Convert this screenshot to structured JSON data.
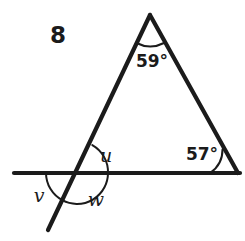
{
  "figure": {
    "exercise_number": "8",
    "background_color": "#ffffff",
    "line_color": "#1b1b1b",
    "labels": {
      "apex_angle": "59°",
      "right_base_angle": "57°",
      "angle_u": "u",
      "angle_v": "v",
      "angle_w": "w"
    },
    "geometry": {
      "apex": [
        150,
        15
      ],
      "left_base_vertex": [
        77,
        173
      ],
      "right_base_vertex": [
        238,
        173
      ],
      "horizontal_line": [
        [
          14,
          173
        ],
        [
          240,
          173
        ]
      ],
      "transversal": [
        [
          150,
          15
        ],
        [
          48,
          230
        ]
      ]
    }
  }
}
